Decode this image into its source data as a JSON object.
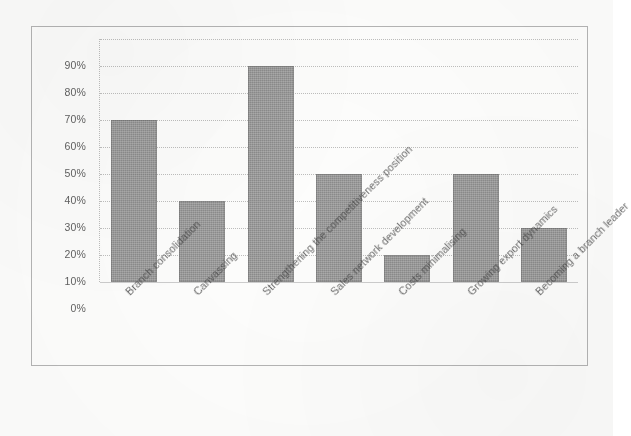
{
  "chart_data": {
    "type": "bar",
    "title": "",
    "subtitle": "",
    "xlabel": "",
    "ylabel": "",
    "ylim": [
      0,
      90
    ],
    "grid": true,
    "legend": false,
    "legend_position": "none",
    "orientation": "vertical",
    "bar_color": "#8c8c8c",
    "categories": [
      "Branch consolidation",
      "Canvassing",
      "Strengthening the competitiveness position",
      "Sales network development",
      "Costs minimalising",
      "Growing export dynamics",
      "Becoming a branch leader"
    ],
    "values": [
      60,
      30,
      80,
      40,
      10,
      40,
      20
    ],
    "value_unit": "%",
    "ytick_labels": [
      "0%",
      "10%",
      "20%",
      "30%",
      "40%",
      "50%",
      "60%",
      "70%",
      "80%",
      "90%"
    ],
    "ytick_values": [
      0,
      10,
      20,
      30,
      40,
      50,
      60,
      70,
      80,
      90
    ]
  },
  "axis": {
    "y_ticks": [
      {
        "label": "90%",
        "value": 90
      },
      {
        "label": "80%",
        "value": 80
      },
      {
        "label": "70%",
        "value": 70
      },
      {
        "label": "60%",
        "value": 60
      },
      {
        "label": "50%",
        "value": 50
      },
      {
        "label": "40%",
        "value": 40
      },
      {
        "label": "30%",
        "value": 30
      },
      {
        "label": "20%",
        "value": 20
      },
      {
        "label": "10%",
        "value": 10
      },
      {
        "label": "0%",
        "value": 0
      }
    ]
  },
  "bars": [
    {
      "label": "Branch consolidation",
      "value": 60,
      "value_label": "60%"
    },
    {
      "label": "Canvassing",
      "value": 30,
      "value_label": "30%"
    },
    {
      "label": "Strengthening the competitiveness position",
      "value": 80,
      "value_label": "80%"
    },
    {
      "label": "Sales network development",
      "value": 40,
      "value_label": "40%"
    },
    {
      "label": "Costs minimalising",
      "value": 10,
      "value_label": "10%"
    },
    {
      "label": "Growing export dynamics",
      "value": 40,
      "value_label": "40%"
    },
    {
      "label": "Becoming a branch leader",
      "value": 20,
      "value_label": "20%"
    }
  ],
  "colors": {
    "bar": "#8c8c8c",
    "grid": "#5f5f5f",
    "text": "#3d3d3d",
    "frame": "#787878"
  }
}
